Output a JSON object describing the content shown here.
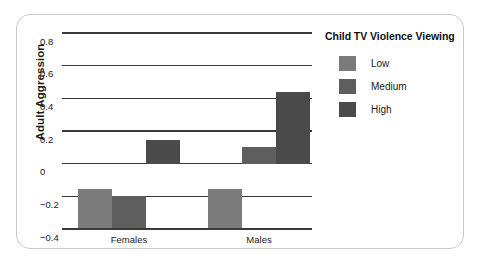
{
  "chart_data": {
    "type": "bar",
    "title": "",
    "xlabel": "",
    "ylabel": "Adult Aggression",
    "categories": [
      "Females",
      "Males"
    ],
    "series": [
      {
        "name": "Low",
        "values": [
          -0.155,
          -0.155
        ],
        "color": "#7b7b7b"
      },
      {
        "name": "Medium",
        "values": [
          -0.2,
          0.1
        ],
        "color": "#5e5e5e"
      },
      {
        "name": "High",
        "values": [
          0.145,
          0.44
        ],
        "color": "#4a4a4a"
      }
    ],
    "legend_title": "Child TV Violence Viewing",
    "legend_position": "right",
    "ylim": [
      -0.4,
      0.8
    ],
    "yticks": [
      0.8,
      0.6,
      0.4,
      0.2,
      0,
      -0.2,
      -0.4
    ],
    "ytick_labels": [
      "0.8",
      "0.6",
      "0.4",
      "0.2",
      "0",
      "−0.2",
      "−0.4"
    ],
    "grid": true,
    "gridline_color": "#3a3a3a",
    "frame_color": "#c9c9c9",
    "background": "#ffffff"
  },
  "axis": {
    "y_title": "Adult Aggression"
  }
}
